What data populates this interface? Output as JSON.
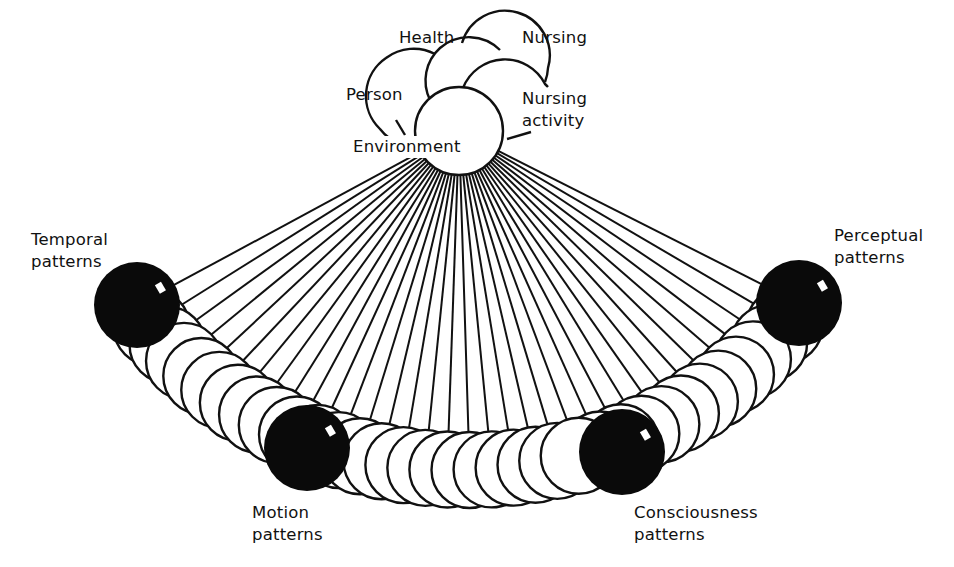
{
  "diagram": {
    "type": "conceptual-model",
    "colors": {
      "ink": "#111111",
      "paper": "#ffffff"
    },
    "metaparadigm": {
      "concepts": [
        {
          "id": "health",
          "label": "Health"
        },
        {
          "id": "nursing",
          "label": "Nursing"
        },
        {
          "id": "person",
          "label": "Person"
        },
        {
          "id": "nursing-activity",
          "label": "Nursing\nactivity"
        },
        {
          "id": "environment",
          "label": "Environment"
        }
      ]
    },
    "patterns": [
      {
        "id": "temporal",
        "label": "Temporal\npatterns"
      },
      {
        "id": "motion",
        "label": "Motion\npatterns"
      },
      {
        "id": "consciousness",
        "label": "Consciousness\npatterns"
      },
      {
        "id": "perceptual",
        "label": "Perceptual\npatterns"
      }
    ]
  }
}
